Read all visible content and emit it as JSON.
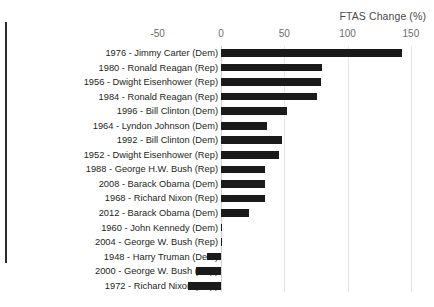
{
  "chart_data": {
    "type": "bar",
    "orientation": "horizontal",
    "title": "FTAS Change (%)",
    "xlabel": "FTAS Change (%)",
    "ylabel": "",
    "xlim": [
      -50,
      150
    ],
    "xticks": [
      -50,
      0,
      50,
      100,
      150
    ],
    "xtick_labels": [
      "-50",
      "0",
      "50",
      "100",
      "150"
    ],
    "grid": true,
    "grid_axis": "x",
    "legend": false,
    "bar_color": "#1a1a1a",
    "categories": [
      "1976 - Jimmy Carter  (Dem)",
      "1980 - Ronald Reagan  (Rep)",
      "1956 - Dwight Eisenhower (Rep)",
      "1984 - Ronald Reagan  (Rep)",
      "1996 - Bill Clinton  (Dem)",
      "1964 - Lyndon Johnson  (Dem)",
      "1992 - Bill Clinton  (Dem)",
      "1952 - Dwight Eisenhower (Rep)",
      "1988 - George H.W. Bush  (Rep)",
      "2008 - Barack Obama (Dem)",
      "1968 - Richard Nixon  (Rep)",
      "2012 - Barack Obama (Dem)",
      "1960 - John Kennedy  (Dem)",
      "2004 - George W. Bush  (Rep)",
      "1948 - Harry Truman (Dem)",
      "2000 - George W. Bush  (Rep)",
      "1972 - Richard Nixon  (Rep)"
    ],
    "values": [
      143,
      80,
      79,
      76,
      52,
      36,
      48,
      46,
      35,
      35,
      35,
      22,
      0,
      0,
      -11,
      -20,
      -26
    ]
  }
}
